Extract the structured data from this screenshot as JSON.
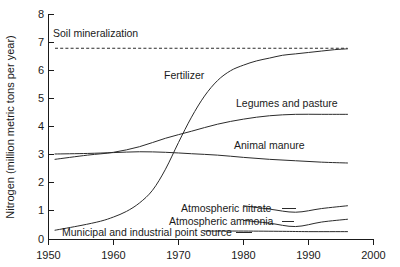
{
  "chart_data": {
    "type": "line",
    "title": "",
    "xlabel": "",
    "ylabel": "Nitrogen (million metric tons per year)",
    "xlim": [
      1950,
      2000
    ],
    "ylim": [
      0,
      8
    ],
    "xticks": [
      1950,
      1960,
      1970,
      1980,
      1990,
      2000
    ],
    "yticks": [
      0,
      1,
      2,
      3,
      4,
      5,
      6,
      7,
      8
    ],
    "grid": false,
    "legend_position": "inline-labels",
    "line_color": "#2b2b2b",
    "series": [
      {
        "name": "Soil mineralization",
        "label": "Soil mineralization",
        "style": "dashed",
        "x": [
          1951,
          1996
        ],
        "values": [
          6.8,
          6.8
        ]
      },
      {
        "name": "Fertilizer",
        "label": "Fertilizer",
        "style": "solid",
        "x": [
          1951,
          1955,
          1958,
          1960,
          1962,
          1964,
          1966,
          1968,
          1970,
          1972,
          1974,
          1976,
          1978,
          1980,
          1982,
          1984,
          1986,
          1988,
          1990,
          1992,
          1994,
          1996
        ],
        "values": [
          0.33,
          0.5,
          0.65,
          0.8,
          1.0,
          1.3,
          1.75,
          2.5,
          3.45,
          4.35,
          5.1,
          5.65,
          6.0,
          6.2,
          6.35,
          6.45,
          6.55,
          6.6,
          6.65,
          6.7,
          6.75,
          6.78
        ]
      },
      {
        "name": "Legumes and pasture",
        "label": "Legumes and pasture",
        "style": "solid",
        "x": [
          1951,
          1956,
          1960,
          1964,
          1968,
          1972,
          1976,
          1980,
          1984,
          1988,
          1992,
          1996
        ],
        "values": [
          2.85,
          3.0,
          3.1,
          3.3,
          3.6,
          3.85,
          4.1,
          4.28,
          4.4,
          4.45,
          4.45,
          4.45
        ]
      },
      {
        "name": "Animal manure",
        "label": "Animal manure",
        "style": "solid",
        "x": [
          1951,
          1956,
          1960,
          1964,
          1968,
          1972,
          1976,
          1980,
          1984,
          1988,
          1992,
          1996
        ],
        "values": [
          3.04,
          3.06,
          3.09,
          3.12,
          3.1,
          3.05,
          3.0,
          2.92,
          2.85,
          2.8,
          2.75,
          2.72
        ]
      },
      {
        "name": "Atmospheric nitrate",
        "label": "Atmospheric nitrate",
        "style": "solid",
        "x": [
          1980,
          1984,
          1988,
          1992,
          1996
        ],
        "values": [
          1.2,
          1.08,
          0.97,
          1.1,
          1.2
        ]
      },
      {
        "name": "Atmospheric ammonia",
        "label": "Atmospheric ammonia",
        "style": "solid",
        "x": [
          1980,
          1984,
          1988,
          1992,
          1996
        ],
        "values": [
          0.68,
          0.58,
          0.46,
          0.62,
          0.72
        ]
      },
      {
        "name": "Municipal and industrial point source",
        "label": "Municipal and industrial point source",
        "style": "solid",
        "x": [
          1974,
          1980,
          1986,
          1990,
          1996
        ],
        "values": [
          0.3,
          0.3,
          0.29,
          0.28,
          0.28
        ]
      }
    ],
    "annotations": [
      {
        "text": "Soil mineralization",
        "x": 1951.5,
        "y": 7.1
      },
      {
        "text": "Fertilizer",
        "x": 1967.5,
        "y": 5.75
      },
      {
        "text": "Legumes and pasture",
        "x": 1979.5,
        "y": 4.8
      },
      {
        "text": "Animal manure",
        "x": 1979.0,
        "y": 3.55
      },
      {
        "text": "Atmospheric nitrate",
        "x": 1972.5,
        "y": 1.32
      },
      {
        "text": "Atmospheric ammonia",
        "x": 1970.5,
        "y": 0.86
      },
      {
        "text": "Municipal and industrial point source",
        "x": 1962.5,
        "y": 0.45
      }
    ]
  },
  "axis": {
    "y_title": "Nitrogen (million metric tons per year)",
    "x_tick_labels": [
      "1950",
      "1960",
      "1970",
      "1980",
      "1990",
      "2000"
    ],
    "y_tick_labels": [
      "0",
      "1",
      "2",
      "3",
      "4",
      "5",
      "6",
      "7",
      "8"
    ]
  },
  "labels": {
    "soil_mineralization": "Soil mineralization",
    "fertilizer": "Fertilizer",
    "legumes_and_pasture": "Legumes and pasture",
    "animal_manure": "Animal manure",
    "atmospheric_nitrate": "Atmospheric nitrate",
    "atmospheric_ammonia": "Atmospheric ammonia",
    "municipal_point_source": "Municipal and industrial point source"
  }
}
